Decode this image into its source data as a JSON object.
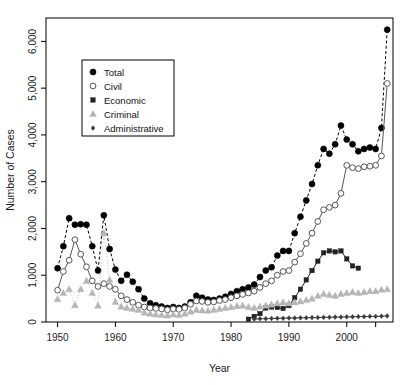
{
  "chart_data": {
    "type": "line",
    "title": "",
    "xlabel": "Year",
    "ylabel": "Number of Cases",
    "xlim": [
      1948,
      2008
    ],
    "ylim": [
      0,
      6500
    ],
    "xticks": [
      1950,
      1960,
      1970,
      1980,
      1990,
      2000
    ],
    "xticklabels": [
      "1950",
      "1960",
      "1970",
      "1980",
      "1990",
      "2000"
    ],
    "yticks": [
      0,
      1000,
      2000,
      3000,
      4000,
      5000,
      6000
    ],
    "yticklabels": [
      "0",
      "1,000",
      "2,000",
      "3,000",
      "4,000",
      "5,000",
      "6,000"
    ],
    "grid": false,
    "legend_position": "top-left",
    "series": [
      {
        "name": "Total",
        "marker": "filled-circle",
        "color": "#000000",
        "linestyle": "dashed",
        "x": [
          1950,
          1951,
          1952,
          1953,
          1954,
          1955,
          1956,
          1957,
          1958,
          1959,
          1960,
          1961,
          1962,
          1963,
          1964,
          1965,
          1966,
          1967,
          1968,
          1969,
          1970,
          1971,
          1972,
          1973,
          1974,
          1975,
          1976,
          1977,
          1978,
          1979,
          1980,
          1981,
          1982,
          1983,
          1984,
          1985,
          1986,
          1987,
          1988,
          1989,
          1990,
          1991,
          1992,
          1993,
          1994,
          1995,
          1996,
          1997,
          1998,
          1999,
          2000,
          2001,
          2002,
          2003,
          2004,
          2005,
          2006,
          2007
        ],
        "values": [
          1150,
          1620,
          2220,
          2080,
          2090,
          2080,
          1620,
          1100,
          2280,
          1560,
          1120,
          880,
          1010,
          860,
          700,
          500,
          400,
          360,
          330,
          300,
          320,
          300,
          330,
          420,
          560,
          520,
          480,
          470,
          500,
          540,
          600,
          660,
          700,
          740,
          800,
          960,
          1100,
          1170,
          1420,
          1520,
          1520,
          1900,
          2250,
          2600,
          2950,
          3350,
          3700,
          3600,
          3800,
          4200,
          3900,
          3800,
          3650,
          3700,
          3730,
          3700,
          4150,
          6250
        ]
      },
      {
        "name": "Civil",
        "marker": "open-circle",
        "color": "#555555",
        "linestyle": "solid",
        "x": [
          1950,
          1951,
          1952,
          1953,
          1954,
          1955,
          1956,
          1957,
          1958,
          1959,
          1960,
          1961,
          1962,
          1963,
          1964,
          1965,
          1966,
          1967,
          1968,
          1969,
          1970,
          1971,
          1972,
          1973,
          1974,
          1975,
          1976,
          1977,
          1978,
          1979,
          1980,
          1981,
          1982,
          1983,
          1984,
          1985,
          1986,
          1987,
          1988,
          1989,
          1990,
          1991,
          1992,
          1993,
          1994,
          1995,
          1996,
          1997,
          1998,
          1999,
          2000,
          2001,
          2002,
          2003,
          2004,
          2005,
          2006,
          2007
        ],
        "values": [
          680,
          1080,
          1320,
          1760,
          1450,
          1180,
          880,
          760,
          820,
          760,
          700,
          560,
          480,
          420,
          360,
          320,
          300,
          290,
          280,
          260,
          280,
          270,
          300,
          380,
          450,
          440,
          420,
          430,
          460,
          480,
          520,
          560,
          590,
          620,
          660,
          740,
          820,
          880,
          1000,
          1080,
          1100,
          1280,
          1460,
          1680,
          1900,
          2150,
          2400,
          2450,
          2500,
          2750,
          3350,
          3300,
          3280,
          3320,
          3330,
          3350,
          3550,
          5100
        ]
      },
      {
        "name": "Economic",
        "marker": "filled-square",
        "color": "#222222",
        "linestyle": "solid",
        "x": [
          1983,
          1984,
          1985,
          1986,
          1987,
          1988,
          1989,
          1990,
          1991,
          1992,
          1993,
          1994,
          1995,
          1996,
          1997,
          1998,
          1999,
          2000,
          2001,
          2002
        ],
        "values": [
          60,
          120,
          180,
          300,
          320,
          310,
          290,
          350,
          520,
          700,
          900,
          1100,
          1300,
          1480,
          1520,
          1500,
          1520,
          1350,
          1200,
          1150
        ]
      },
      {
        "name": "Criminal",
        "marker": "filled-triangle",
        "color": "#b5b5b5",
        "linestyle": "dotted",
        "x": [
          1950,
          1951,
          1952,
          1953,
          1954,
          1955,
          1956,
          1957,
          1958,
          1959,
          1960,
          1961,
          1962,
          1963,
          1964,
          1965,
          1966,
          1967,
          1968,
          1969,
          1970,
          1971,
          1972,
          1973,
          1974,
          1975,
          1976,
          1977,
          1978,
          1979,
          1980,
          1981,
          1982,
          1983,
          1984,
          1985,
          1986,
          1987,
          1988,
          1989,
          1990,
          1991,
          1992,
          1993,
          1994,
          1995,
          1996,
          1997,
          1998,
          1999,
          2000,
          2001,
          2002,
          2003,
          2004,
          2005,
          2006,
          2007
        ],
        "values": [
          490,
          620,
          700,
          360,
          700,
          880,
          620,
          350,
          1900,
          900,
          430,
          330,
          300,
          280,
          260,
          200,
          180,
          160,
          150,
          140,
          160,
          150,
          180,
          220,
          260,
          250,
          240,
          260,
          280,
          300,
          320,
          340,
          350,
          320,
          300,
          330,
          350,
          370,
          400,
          420,
          400,
          420,
          440,
          470,
          500,
          560,
          600,
          580,
          560,
          600,
          620,
          640,
          620,
          640,
          660,
          660,
          690,
          700
        ]
      },
      {
        "name": "Administrative",
        "marker": "small-diamond",
        "color": "#3a3a3a",
        "linestyle": "solid",
        "x": [
          1984,
          1985,
          1986,
          1987,
          1988,
          1989,
          1990,
          1991,
          1992,
          1993,
          1994,
          1995,
          1996,
          1997,
          1998,
          1999,
          2000,
          2001,
          2002,
          2003,
          2004,
          2005,
          2006,
          2007
        ],
        "values": [
          60,
          70,
          70,
          75,
          80,
          80,
          85,
          85,
          90,
          90,
          95,
          95,
          100,
          100,
          105,
          105,
          110,
          110,
          115,
          115,
          120,
          120,
          125,
          130
        ]
      }
    ]
  },
  "legend": {
    "items": [
      {
        "label": "Total"
      },
      {
        "label": "Civil"
      },
      {
        "label": "Economic"
      },
      {
        "label": "Criminal"
      },
      {
        "label": "Administrative"
      }
    ]
  }
}
